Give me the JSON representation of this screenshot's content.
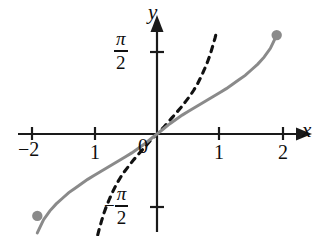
{
  "figure": {
    "kind": "math-graph",
    "background": "#ffffff",
    "curve_color": "#8a8a8a",
    "dashed_color": "#111111",
    "axis_color": "#1a1a1a"
  },
  "axes": {
    "x_label": "x",
    "y_label": "y",
    "origin_label": "0",
    "x_ticks": [
      {
        "value": -2,
        "label": "−2",
        "px": 32
      },
      {
        "value": -1,
        "label": "1",
        "px": 95
      },
      {
        "value": 1,
        "label": "1",
        "px": 219
      },
      {
        "value": 2,
        "label": "2",
        "px": 283
      }
    ],
    "y_ticks": [
      {
        "value": 1.5708,
        "numerator": "π",
        "denominator": "2",
        "sign": "",
        "px": 52
      },
      {
        "value": -1.5708,
        "numerator": "π",
        "denominator": "2",
        "sign": "−",
        "px": 207
      }
    ],
    "origin_px": {
      "x": 157,
      "y": 134
    },
    "unit_px": 63,
    "x_range": [
      -2.3,
      2.45
    ],
    "y_range": [
      -1.85,
      1.95
    ]
  },
  "chart_data": {
    "type": "line",
    "title": "",
    "xlabel": "x",
    "ylabel": "y",
    "xlim": [
      -2.3,
      2.45
    ],
    "ylim": [
      -1.85,
      1.95
    ],
    "grid": false,
    "legend": "none",
    "series": [
      {
        "name": "arcsin-like solid curve",
        "style": "solid",
        "color": "#8a8a8a",
        "endpoints": "filled-dots",
        "x": [
          -1.9,
          -1.8,
          -1.7,
          -1.6,
          -1.5,
          -1.4,
          -1.3,
          -1.2,
          -1.1,
          -1.0,
          -0.9,
          -0.8,
          -0.7,
          -0.6,
          -0.5,
          -0.4,
          -0.3,
          -0.2,
          -0.1,
          0.0,
          0.1,
          0.2,
          0.3,
          0.4,
          0.5,
          0.6,
          0.7,
          0.8,
          0.9,
          1.0,
          1.1,
          1.2,
          1.3,
          1.4,
          1.5,
          1.6,
          1.7,
          1.8,
          1.9
        ],
        "y": [
          -1.57,
          -1.36,
          -1.22,
          -1.11,
          -1.02,
          -0.93,
          -0.86,
          -0.79,
          -0.72,
          -0.66,
          -0.6,
          -0.54,
          -0.48,
          -0.42,
          -0.36,
          -0.3,
          -0.23,
          -0.16,
          -0.08,
          0.0,
          0.08,
          0.16,
          0.23,
          0.3,
          0.36,
          0.42,
          0.48,
          0.54,
          0.6,
          0.66,
          0.72,
          0.79,
          0.86,
          0.93,
          1.02,
          1.11,
          1.22,
          1.36,
          1.57
        ]
      },
      {
        "name": "tangent-like dashed curve",
        "style": "dashed",
        "color": "#111111",
        "endpoints": "open",
        "x": [
          -0.98,
          -0.95,
          -0.92,
          -0.88,
          -0.84,
          -0.8,
          -0.75,
          -0.7,
          -0.64,
          -0.58,
          -0.52,
          -0.45,
          -0.38,
          -0.31,
          -0.24,
          -0.17,
          -0.1,
          -0.04,
          0.0,
          0.04,
          0.1,
          0.17,
          0.24,
          0.31,
          0.38,
          0.45,
          0.52,
          0.58,
          0.64,
          0.7,
          0.75,
          0.8,
          0.84,
          0.88,
          0.92,
          0.95
        ],
        "y": [
          -1.78,
          -1.64,
          -1.52,
          -1.38,
          -1.25,
          -1.14,
          -1.02,
          -0.91,
          -0.79,
          -0.69,
          -0.6,
          -0.51,
          -0.42,
          -0.34,
          -0.26,
          -0.18,
          -0.1,
          -0.04,
          0.0,
          0.04,
          0.1,
          0.18,
          0.26,
          0.34,
          0.42,
          0.51,
          0.6,
          0.69,
          0.79,
          0.91,
          1.02,
          1.14,
          1.25,
          1.38,
          1.52,
          1.64
        ]
      }
    ],
    "markers": [
      {
        "name": "upper-right-endpoint",
        "x": 1.9,
        "y": 1.57,
        "filled": true,
        "color": "#8a8a8a"
      },
      {
        "name": "lower-left-endpoint",
        "x": -1.9,
        "y": -1.3,
        "filled": true,
        "color": "#8a8a8a"
      }
    ]
  }
}
